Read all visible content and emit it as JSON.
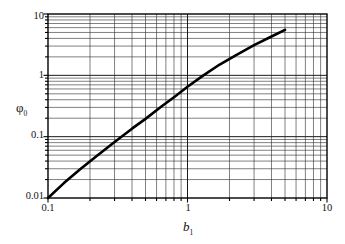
{
  "chart_data": {
    "type": "line",
    "title": "",
    "subtitle": "",
    "xlabel": "b",
    "xlabel_sub": "1",
    "ylabel": "φ",
    "ylabel_sub": "0",
    "xscale": "log",
    "yscale": "log",
    "xlim": [
      0.1,
      10
    ],
    "ylim": [
      0.01,
      10
    ],
    "grid": true,
    "grid_minor": true,
    "legend": null,
    "legend_position": "none",
    "x_tick_labels": [
      "0.1",
      "1",
      "10"
    ],
    "x_tick_values": [
      0.1,
      1,
      10
    ],
    "y_tick_labels": [
      "0.01",
      "0.1",
      "1",
      "10"
    ],
    "y_tick_values": [
      0.01,
      0.1,
      1,
      10
    ],
    "series": [
      {
        "name": "phi0 vs b1",
        "color": "#000000",
        "x": [
          0.1,
          0.13,
          0.17,
          0.22,
          0.3,
          0.4,
          0.5,
          0.65,
          0.8,
          1.0,
          1.3,
          1.7,
          2.2,
          3.0,
          4.0,
          5.0
        ],
        "y": [
          0.01,
          0.0175,
          0.0295,
          0.047,
          0.082,
          0.135,
          0.195,
          0.31,
          0.44,
          0.65,
          1.0,
          1.5,
          2.1,
          3.1,
          4.3,
          5.5
        ]
      }
    ],
    "annotations": []
  }
}
